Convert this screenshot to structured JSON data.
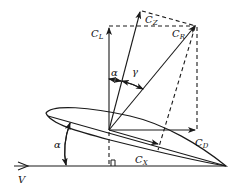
{
  "diagram": {
    "labels": {
      "lift": {
        "base": "C",
        "sub": "L"
      },
      "normal": {
        "base": "C",
        "sub": "Z"
      },
      "resultant": {
        "base": "C",
        "sub": "R"
      },
      "drag": {
        "base": "C",
        "sub": "D"
      },
      "axial": {
        "base": "C",
        "sub": "X"
      },
      "alpha_top": "α",
      "gamma": "γ",
      "alpha_left": "α",
      "velocity": "V"
    },
    "colors": {
      "stroke": "#1a1a1a",
      "background": "#ffffff"
    }
  }
}
